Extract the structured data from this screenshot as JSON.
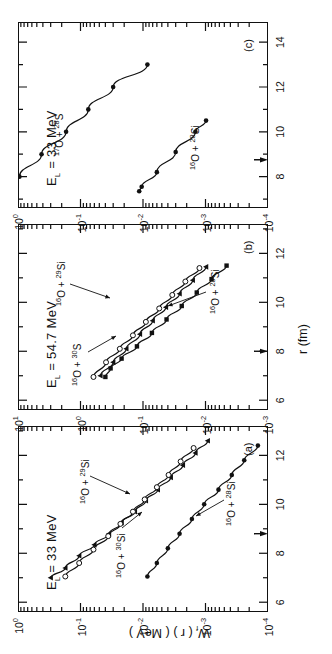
{
  "figure": {
    "axis": {
      "x_title": "r (fm)",
      "y_title_main": "W",
      "y_title_sub": "f",
      "y_title_rest": " ( r )   ( MeV )"
    },
    "panels": [
      {
        "tag": "(a)",
        "energy_label_prefix": "E",
        "energy_label_sub": "L",
        "energy_label_value": " = 33 MeV",
        "x_ticks": [
          "6",
          "8",
          "10",
          "12"
        ],
        "x_tick_values": [
          6,
          8,
          10,
          12
        ],
        "x_range": [
          5.6,
          13.2
        ],
        "y_ticks": [
          "10",
          "10",
          "10",
          "10",
          "10"
        ],
        "y_tick_exps": [
          "0",
          "-1",
          "-2",
          "-3",
          "-4"
        ],
        "y_range_exp": [
          -4,
          0
        ],
        "arrow_x": 8.8,
        "curve_labels": [
          {
            "text_pre": "",
            "sup1": "16",
            "mid": "O + ",
            "sup2": "30",
            "post": "Si"
          },
          {
            "text_pre": "",
            "sup1": "16",
            "mid": "O + ",
            "sup2": "29",
            "post": "Si"
          },
          {
            "text_pre": "",
            "sup1": "16",
            "mid": "O + ",
            "sup2": "28",
            "post": "Si"
          }
        ]
      },
      {
        "tag": "(b)",
        "energy_label_prefix": "E",
        "energy_label_sub": "L",
        "energy_label_value": " = 54.7 MeV",
        "x_ticks": [
          "6",
          "8",
          "10",
          "12"
        ],
        "x_tick_values": [
          6,
          8,
          10,
          12
        ],
        "x_range": [
          5.6,
          13.2
        ],
        "y_ticks": [
          "10",
          "10",
          "10",
          "10",
          "10"
        ],
        "y_tick_exps": [
          "1",
          "0",
          "-1",
          "-2",
          "-3"
        ],
        "y_range_exp": [
          -3,
          1
        ],
        "arrow_x": 8.0,
        "curve_labels": [
          {
            "text_pre": "",
            "sup1": "16",
            "mid": "O + ",
            "sup2": "30",
            "post": "S"
          },
          {
            "text_pre": "",
            "sup1": "16",
            "mid": "O + ",
            "sup2": "29",
            "post": "Si"
          },
          {
            "text_pre": "",
            "sup1": "16",
            "mid": "O + ",
            "sup2": "28",
            "post": "Si"
          }
        ]
      },
      {
        "tag": "(c)",
        "energy_label_prefix": "E",
        "energy_label_sub": "L",
        "energy_label_value": " = 33 MeV",
        "x_ticks": [
          "8",
          "10",
          "12",
          "14"
        ],
        "x_tick_values": [
          8,
          10,
          12,
          14
        ],
        "x_range": [
          6.6,
          14.9
        ],
        "y_ticks": [
          "10",
          "10",
          "10",
          "10",
          "10"
        ],
        "y_tick_exps": [
          "0",
          "-1",
          "-2",
          "-3",
          "-4"
        ],
        "y_range_exp": [
          -4,
          0
        ],
        "arrow_x": 8.75,
        "curve_labels": [
          {
            "text_pre": "",
            "sup1": "17",
            "mid": "O + ",
            "sup2": "28",
            "post": "S"
          },
          {
            "text_pre": "",
            "sup1": "16",
            "mid": "O + ",
            "sup2": "28",
            "post": "Si"
          }
        ]
      }
    ]
  },
  "chart_data": {
    "type": "scatter",
    "title": "",
    "xlabel": "r (fm)",
    "ylabel": "W_f (r) (MeV)",
    "yscale": "log",
    "grid": false,
    "legend": "inline-annotations",
    "panels": [
      {
        "tag": "(a)",
        "annotation": "E_L = 33 MeV",
        "xlim": [
          5.6,
          13.2
        ],
        "ylim": [
          0.0001,
          1.0
        ],
        "xticks": [
          6,
          8,
          10,
          12
        ],
        "yticks": [
          0.0001,
          0.001,
          0.01,
          0.1,
          1.0
        ],
        "series": [
          {
            "name": "16O + 30Si",
            "marker": "filled-triangle",
            "x": [
              7.0,
              7.4,
              7.9,
              8.35,
              8.8,
              9.25,
              9.7,
              10.15,
              10.6,
              11.1,
              11.6,
              12.1,
              12.6
            ],
            "y": [
              0.3,
              0.175,
              0.105,
              0.06,
              0.035,
              0.022,
              0.0135,
              0.009,
              0.0058,
              0.0036,
              0.0023,
              0.00145,
              0.00092
            ]
          },
          {
            "name": "16O + 29Si",
            "marker": "open-circle",
            "x": [
              7.05,
              7.6,
              8.15,
              8.7,
              9.2,
              9.7,
              10.2,
              10.7,
              11.2,
              11.75,
              12.3
            ],
            "y": [
              0.175,
              0.105,
              0.062,
              0.036,
              0.023,
              0.0145,
              0.0094,
              0.006,
              0.0039,
              0.0025,
              0.00155
            ]
          },
          {
            "name": "16O + 28Si",
            "marker": "filled-circle",
            "x": [
              7.05,
              7.6,
              8.2,
              8.8,
              9.4,
              10.0,
              10.6,
              11.2,
              11.8,
              12.4
            ],
            "y": [
              0.0085,
              0.006,
              0.004,
              0.0026,
              0.00165,
              0.00105,
              0.00062,
              0.00038,
              0.00024,
              0.000145
            ]
          }
        ]
      },
      {
        "tag": "(b)",
        "annotation": "E_L = 54.7 MeV",
        "xlim": [
          5.6,
          13.2
        ],
        "ylim": [
          0.001,
          10.0
        ],
        "xticks": [
          6,
          8,
          10,
          12
        ],
        "yticks": [
          0.001,
          0.01,
          0.1,
          1.0,
          10.0
        ],
        "series": [
          {
            "name": "16O + 30S",
            "marker": "open-circle",
            "x": [
              6.95,
              7.55,
              8.1,
              8.65,
              9.2,
              9.75,
              10.3,
              10.85,
              11.4
            ],
            "y": [
              0.62,
              0.39,
              0.235,
              0.145,
              0.09,
              0.055,
              0.034,
              0.021,
              0.0125
            ]
          },
          {
            "name": "16O + 29Si",
            "marker": "filled-triangle",
            "x": [
              7.0,
              7.55,
              8.1,
              8.7,
              9.25,
              9.8,
              10.35,
              10.9,
              11.45
            ],
            "y": [
              0.48,
              0.3,
              0.185,
              0.112,
              0.07,
              0.043,
              0.026,
              0.016,
              0.0098
            ]
          },
          {
            "name": "16O + 28Si",
            "marker": "filled-square",
            "x": [
              6.95,
              7.3,
              7.7,
              8.2,
              8.75,
              9.3,
              9.85,
              10.4,
              10.95,
              11.5
            ],
            "y": [
              0.4,
              0.33,
              0.22,
              0.125,
              0.072,
              0.042,
              0.024,
              0.0138,
              0.008,
              0.0046
            ]
          }
        ]
      },
      {
        "tag": "(c)",
        "annotation": "E_L = 33 MeV",
        "xlim": [
          6.6,
          14.9
        ],
        "ylim": [
          0.0001,
          1.0
        ],
        "xticks": [
          8,
          10,
          12,
          14
        ],
        "yticks": [
          0.0001,
          0.001,
          0.01,
          0.1,
          1.0
        ],
        "series": [
          {
            "name": "17O + 28S",
            "marker": "filled-circle",
            "x": [
              8.0,
              9.0,
              10.0,
              11.0,
              12.0,
              13.0
            ],
            "y": [
              0.95,
              0.42,
              0.17,
              0.075,
              0.03,
              0.0085
            ]
          },
          {
            "name": "16O + 28Si",
            "marker": "filled-circle",
            "x": [
              7.35,
              7.55,
              8.2,
              9.1,
              10.0,
              10.5
            ],
            "y": [
              0.0115,
              0.0105,
              0.006,
              0.003,
              0.00145,
              0.00098
            ]
          }
        ]
      }
    ]
  }
}
